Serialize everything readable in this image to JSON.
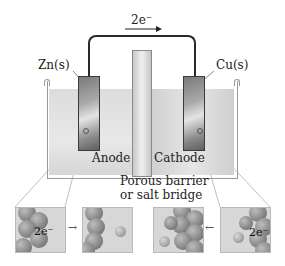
{
  "diagram": {
    "type": "galvanic-cell",
    "electron_flow_label": "2e⁻",
    "left_electrode": {
      "label": "Zn(s)",
      "role": "Anode"
    },
    "right_electrode": {
      "label": "Cu(s)",
      "role": "Cathode"
    },
    "barrier_label_line1": "Porous barrier",
    "barrier_label_line2": "or salt bridge",
    "insets": {
      "anode_before_electrons": "2e⁻",
      "anode_arrow": "→",
      "cathode_arrow": "←",
      "cathode_after_electrons": "2e⁻"
    },
    "colors": {
      "wire": "#2a2a2a",
      "electrode": "#8d8d8d",
      "solution": "#e0e0e0",
      "beaker_outline": "#9a9a9a",
      "leader_lines": "#a8a8a8"
    }
  }
}
